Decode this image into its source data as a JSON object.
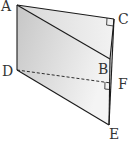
{
  "diagram": {
    "type": "geometry-solid",
    "labels": {
      "A": "A",
      "B": "B",
      "C": "C",
      "D": "D",
      "E": "E",
      "F": "F"
    },
    "points": {
      "A": [
        17,
        5
      ],
      "C": [
        114,
        19
      ],
      "B": [
        110,
        59
      ],
      "D": [
        17,
        70
      ],
      "F": [
        111,
        83
      ],
      "E": [
        109,
        125
      ]
    },
    "right_angles": [
      "C",
      "F"
    ],
    "colors": {
      "stroke": "#1a1a1a",
      "fill_light": "#ededed",
      "fill_dark": "#c8c8c8"
    }
  }
}
